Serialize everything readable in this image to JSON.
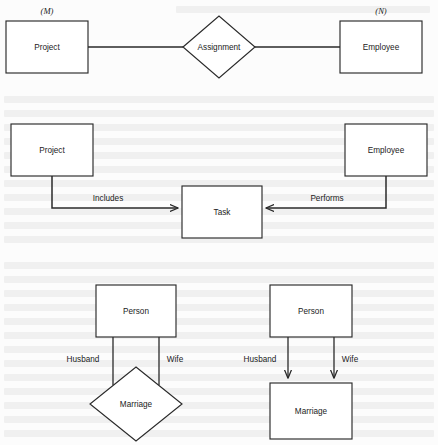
{
  "figure": {
    "kind": "er-diagram-figure",
    "background_color": "#fcfcfc",
    "line_color": "#2a2a2a",
    "fill_color": "#ffffff",
    "width": 438,
    "height": 445
  },
  "diagrams": [
    {
      "id": "diagram-assignment",
      "notation": "chen-diamond",
      "entities": [
        {
          "name": "Project",
          "label": "Project",
          "cardinality": "(M)"
        },
        {
          "name": "Employee",
          "label": "Employee",
          "cardinality": "(N)"
        }
      ],
      "relationship": {
        "name": "Assignment",
        "label": "Assignment",
        "shape": "diamond"
      },
      "edges": [
        {
          "from": "Project",
          "to": "Assignment",
          "arrow": false,
          "label": ""
        },
        {
          "from": "Assignment",
          "to": "Employee",
          "arrow": false,
          "label": ""
        }
      ]
    },
    {
      "id": "diagram-task",
      "notation": "bachman-arrow",
      "entities": [
        {
          "name": "Project",
          "label": "Project",
          "cardinality": ""
        },
        {
          "name": "Task",
          "label": "Task",
          "cardinality": ""
        },
        {
          "name": "Employee",
          "label": "Employee",
          "cardinality": ""
        }
      ],
      "relationship": null,
      "edges": [
        {
          "from": "Project",
          "to": "Task",
          "arrow": true,
          "label": "Includes"
        },
        {
          "from": "Employee",
          "to": "Task",
          "arrow": true,
          "label": "Performs"
        }
      ]
    },
    {
      "id": "diagram-marriage-diamond",
      "notation": "chen-diamond",
      "entities": [
        {
          "name": "Person",
          "label": "Person",
          "cardinality": ""
        }
      ],
      "relationship": {
        "name": "Marriage",
        "label": "Marriage",
        "shape": "diamond"
      },
      "edges": [
        {
          "from": "Person",
          "to": "Marriage",
          "arrow": false,
          "label": "Husband"
        },
        {
          "from": "Person",
          "to": "Marriage",
          "arrow": false,
          "label": "Wife"
        }
      ]
    },
    {
      "id": "diagram-marriage-box",
      "notation": "bachman-arrow",
      "entities": [
        {
          "name": "Person",
          "label": "Person",
          "cardinality": ""
        },
        {
          "name": "Marriage",
          "label": "Marriage",
          "cardinality": ""
        }
      ],
      "relationship": null,
      "edges": [
        {
          "from": "Person",
          "to": "Marriage",
          "arrow": true,
          "label": "Husband"
        },
        {
          "from": "Person",
          "to": "Marriage",
          "arrow": true,
          "label": "Wife"
        }
      ]
    }
  ],
  "labels": {
    "project_top": "Project",
    "employee_top": "Employee",
    "assignment": "Assignment",
    "cardinality_m": "(M)",
    "cardinality_n": "(N)",
    "project_mid": "Project",
    "employee_mid": "Employee",
    "task": "Task",
    "includes": "Includes",
    "performs": "Performs",
    "person_left": "Person",
    "person_right": "Person",
    "marriage_left": "Marriage",
    "marriage_right": "Marriage",
    "husband_left": "Husband",
    "wife_left": "Wife",
    "husband_right": "Husband",
    "wife_right": "Wife"
  }
}
